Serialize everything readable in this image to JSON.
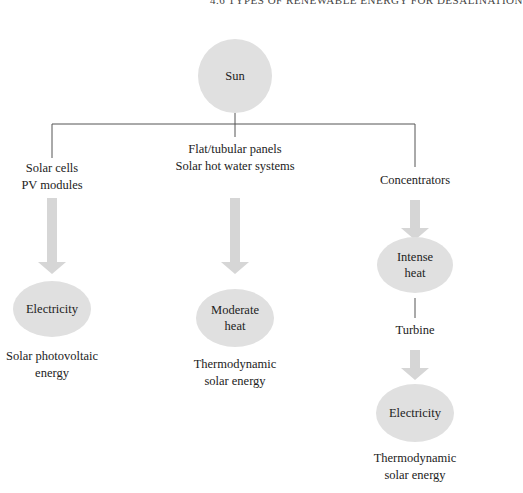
{
  "header": {
    "text": "4.6 TYPES OF RENEWABLE ENERGY FOR DESALINATION"
  },
  "colors": {
    "node_fill": "#e0e0e0",
    "arrow_fill": "#d6d6d6",
    "line": "#555555",
    "text": "#222222"
  },
  "root": {
    "label": "Sun"
  },
  "branches": [
    {
      "source_lines": [
        "Solar cells",
        "PV modules"
      ],
      "output": {
        "lines": [
          "Electricity"
        ]
      },
      "caption_lines": [
        "Solar photovoltaic",
        "energy"
      ]
    },
    {
      "source_lines": [
        "Flat/tubular panels",
        "Solar hot water systems"
      ],
      "output": {
        "lines": [
          "Moderate",
          "heat"
        ]
      },
      "caption_lines": [
        "Thermodynamic",
        "solar energy"
      ]
    },
    {
      "source_lines": [
        "Concentrators"
      ],
      "intermediate": {
        "lines": [
          "Intense",
          "heat"
        ]
      },
      "converter": "Turbine",
      "output": {
        "lines": [
          "Electricity"
        ]
      },
      "caption_lines": [
        "Thermodynamic",
        "solar energy"
      ]
    }
  ]
}
